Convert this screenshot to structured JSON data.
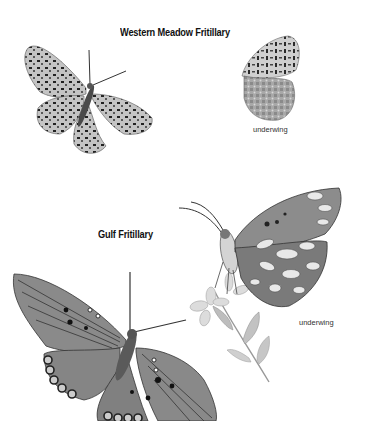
{
  "page": {
    "background": "#ffffff"
  },
  "sections": [
    {
      "title": "Western Meadow Fritillary",
      "illustrations": [
        {
          "view": "upperwing",
          "caption": ""
        },
        {
          "view": "underwing",
          "caption": "underwing"
        }
      ]
    },
    {
      "title": "Gulf Fritillary",
      "illustrations": [
        {
          "view": "upperwing",
          "caption": ""
        },
        {
          "view": "underwing",
          "caption": "underwing"
        }
      ]
    }
  ],
  "colors": {
    "ink": "#111111",
    "wing_light": "#c8c8c8",
    "wing_mid": "#8a8a8a",
    "wing_dark": "#4a4a4a",
    "spot_silver": "#e6e6e6"
  }
}
